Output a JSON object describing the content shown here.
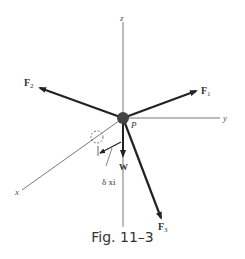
{
  "figure": {
    "caption": "Fig. 11–3",
    "axes": {
      "x": "x",
      "y": "y",
      "z": "z"
    },
    "point_label": "P",
    "forces": {
      "F1": {
        "label": "F",
        "sub": "1"
      },
      "F2": {
        "label": "F",
        "sub": "2"
      },
      "F3": {
        "label": "F",
        "sub": "3"
      },
      "W": {
        "label": "W"
      }
    },
    "displacement_label": "δ xi"
  }
}
